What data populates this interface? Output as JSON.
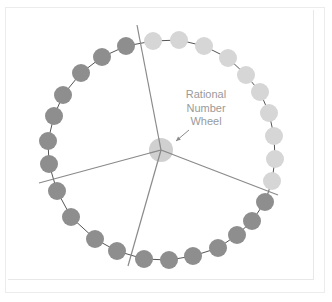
{
  "diagram": {
    "title_lines": [
      "Rational",
      "Number",
      "Wheel"
    ],
    "colors": {
      "dark_bead": "#8e8e8e",
      "light_bead": "#d6d6d6",
      "string": "#555555",
      "spoke": "#8a8a8a",
      "hub": "#c8c8c8",
      "label": "#9a9a9a"
    },
    "hub": {
      "cx": 161,
      "cy": 150,
      "r": 12
    },
    "spokes": [
      {
        "x2": 137,
        "y2": 25
      },
      {
        "x2": 39,
        "y2": 183
      },
      {
        "x2": 128,
        "y2": 266
      },
      {
        "x2": 278,
        "y2": 195
      }
    ],
    "bead_radius": 9,
    "beads": [
      {
        "x": 153,
        "y": 41,
        "shade": "light"
      },
      {
        "x": 179,
        "y": 40,
        "shade": "light"
      },
      {
        "x": 204,
        "y": 46,
        "shade": "light"
      },
      {
        "x": 228,
        "y": 58,
        "shade": "light"
      },
      {
        "x": 246,
        "y": 75,
        "shade": "light"
      },
      {
        "x": 260,
        "y": 92,
        "shade": "light"
      },
      {
        "x": 269,
        "y": 113,
        "shade": "light"
      },
      {
        "x": 274,
        "y": 136,
        "shade": "light"
      },
      {
        "x": 275,
        "y": 159,
        "shade": "light"
      },
      {
        "x": 272,
        "y": 181,
        "shade": "light"
      },
      {
        "x": 265,
        "y": 202,
        "shade": "dark"
      },
      {
        "x": 252,
        "y": 221,
        "shade": "dark"
      },
      {
        "x": 237,
        "y": 235,
        "shade": "dark"
      },
      {
        "x": 218,
        "y": 248,
        "shade": "dark"
      },
      {
        "x": 193,
        "y": 256,
        "shade": "dark"
      },
      {
        "x": 169,
        "y": 260,
        "shade": "dark"
      },
      {
        "x": 144,
        "y": 259,
        "shade": "dark"
      },
      {
        "x": 117,
        "y": 251,
        "shade": "dark"
      },
      {
        "x": 95,
        "y": 239,
        "shade": "dark"
      },
      {
        "x": 71,
        "y": 217,
        "shade": "dark"
      },
      {
        "x": 57,
        "y": 191,
        "shade": "dark"
      },
      {
        "x": 49,
        "y": 164,
        "shade": "dark"
      },
      {
        "x": 48,
        "y": 141,
        "shade": "dark"
      },
      {
        "x": 54,
        "y": 116,
        "shade": "dark"
      },
      {
        "x": 63,
        "y": 95,
        "shade": "dark"
      },
      {
        "x": 81,
        "y": 73,
        "shade": "dark"
      },
      {
        "x": 102,
        "y": 57,
        "shade": "dark"
      },
      {
        "x": 126,
        "y": 46,
        "shade": "dark"
      }
    ],
    "arrow": {
      "x1": 189,
      "y1": 130,
      "x2": 176,
      "y2": 141
    }
  }
}
